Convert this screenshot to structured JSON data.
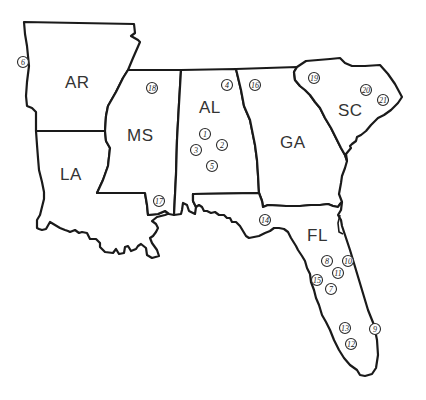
{
  "map": {
    "title": "",
    "stroke_color": "#1a1a1a",
    "background": "#ffffff",
    "states": [
      {
        "abbr": "AR",
        "label_x": 77,
        "label_y": 88
      },
      {
        "abbr": "MS",
        "label_x": 142,
        "label_y": 141
      },
      {
        "abbr": "AL",
        "label_x": 210,
        "label_y": 113
      },
      {
        "abbr": "GA",
        "label_x": 295,
        "label_y": 148
      },
      {
        "abbr": "SC",
        "label_x": 352,
        "label_y": 116
      },
      {
        "abbr": "LA",
        "label_x": 73,
        "label_y": 180
      },
      {
        "abbr": "FL",
        "label_x": 321,
        "label_y": 241
      }
    ],
    "markers": [
      {
        "num": "1",
        "x": 205,
        "y": 134
      },
      {
        "num": "2",
        "x": 222,
        "y": 145
      },
      {
        "num": "3",
        "x": 196,
        "y": 150
      },
      {
        "num": "4",
        "x": 227,
        "y": 85
      },
      {
        "num": "5",
        "x": 212,
        "y": 166
      },
      {
        "num": "6",
        "x": 23,
        "y": 62
      },
      {
        "num": "7",
        "x": 331,
        "y": 289
      },
      {
        "num": "8",
        "x": 327,
        "y": 261
      },
      {
        "num": "9",
        "x": 375,
        "y": 329
      },
      {
        "num": "10",
        "x": 348,
        "y": 261
      },
      {
        "num": "11",
        "x": 338,
        "y": 273
      },
      {
        "num": "12",
        "x": 351,
        "y": 344
      },
      {
        "num": "13",
        "x": 345,
        "y": 328
      },
      {
        "num": "14",
        "x": 265,
        "y": 220
      },
      {
        "num": "15",
        "x": 317,
        "y": 280
      },
      {
        "num": "16",
        "x": 255,
        "y": 85
      },
      {
        "num": "17",
        "x": 159,
        "y": 201
      },
      {
        "num": "18",
        "x": 152,
        "y": 88
      },
      {
        "num": "19",
        "x": 314,
        "y": 78
      },
      {
        "num": "20",
        "x": 366,
        "y": 90
      },
      {
        "num": "21",
        "x": 383,
        "y": 100
      }
    ]
  }
}
